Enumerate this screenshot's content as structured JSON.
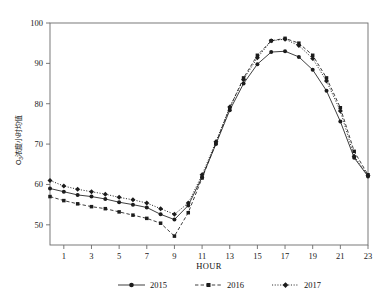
{
  "chart_data": {
    "type": "line",
    "title": "",
    "xlabel": "HOUR",
    "ylabel": "O3浓度小时均值",
    "ylabel_main": "浓度小时均值",
    "ylabel_symbol": "O",
    "ylabel_subscript": "3",
    "xlim": [
      0,
      23
    ],
    "ylim": [
      45,
      100
    ],
    "ytick_values": [
      50,
      60,
      70,
      80,
      90,
      100
    ],
    "ytick_labels": [
      "50",
      "60",
      "70",
      "80",
      "90",
      "100"
    ],
    "xtick_values": [
      1,
      3,
      5,
      7,
      9,
      11,
      13,
      15,
      17,
      19,
      21,
      23
    ],
    "xtick_labels": [
      "1",
      "3",
      "5",
      "7",
      "9",
      "11",
      "13",
      "15",
      "17",
      "19",
      "21",
      "23"
    ],
    "x": [
      0,
      1,
      2,
      3,
      4,
      5,
      6,
      7,
      8,
      9,
      10,
      11,
      12,
      13,
      14,
      15,
      16,
      17,
      18,
      19,
      20,
      21,
      22,
      23
    ],
    "grid": false,
    "legend_position": "bottom",
    "series": [
      {
        "name": "2015",
        "marker": "circle",
        "dash": "solid",
        "color": "#1c1c1c",
        "values": [
          59.0,
          58.2,
          57.4,
          57.0,
          56.4,
          55.6,
          55.0,
          54.3,
          52.6,
          51.3,
          54.8,
          61.8,
          70.0,
          78.4,
          85.0,
          89.8,
          92.8,
          93.0,
          91.6,
          88.4,
          83.2,
          75.6,
          66.6,
          62.0
        ]
      },
      {
        "name": "2016",
        "marker": "square",
        "dash": "dashed",
        "color": "#1c1c1c",
        "values": [
          57.0,
          56.0,
          55.2,
          54.5,
          54.0,
          53.2,
          52.4,
          51.6,
          50.4,
          47.2,
          53.0,
          61.6,
          70.2,
          79.0,
          86.4,
          92.0,
          95.6,
          96.2,
          95.0,
          92.0,
          86.4,
          79.0,
          68.2,
          62.4
        ]
      },
      {
        "name": "2017",
        "marker": "diamond",
        "dash": "dotted",
        "color": "#1c1c1c",
        "values": [
          61.0,
          59.6,
          58.8,
          58.2,
          57.6,
          56.8,
          56.2,
          55.4,
          54.0,
          52.6,
          55.4,
          62.4,
          70.6,
          79.2,
          86.0,
          91.4,
          95.6,
          96.0,
          94.4,
          91.2,
          85.6,
          78.2,
          67.0,
          62.2
        ]
      }
    ]
  },
  "legend": {
    "entries": [
      {
        "label": "2015"
      },
      {
        "label": "2016"
      },
      {
        "label": "2017"
      }
    ]
  }
}
